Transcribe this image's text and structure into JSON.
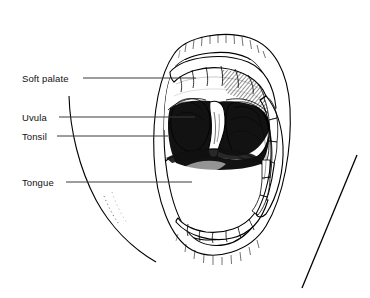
{
  "figure": {
    "style": "black and white line drawing with stipple and hatch shading",
    "background_color": "#ffffff",
    "ink_color": "#000000",
    "leader_color": "#3a3a3a"
  },
  "labels": [
    {
      "id": "soft-palate",
      "text": "Soft palate",
      "text_x": 22,
      "text_y": 82,
      "leader_start_x": 83,
      "leader_start_y": 78,
      "leader_end_x": 196,
      "leader_end_y": 78
    },
    {
      "id": "uvula",
      "text": "Uvula",
      "text_x": 22,
      "text_y": 121,
      "leader_start_x": 59,
      "leader_start_y": 117,
      "leader_end_x": 195,
      "leader_end_y": 117
    },
    {
      "id": "tonsil",
      "text": "Tonsil",
      "text_x": 22,
      "text_y": 140,
      "leader_start_x": 57,
      "leader_start_y": 136,
      "leader_end_x": 168,
      "leader_end_y": 136
    },
    {
      "id": "tongue",
      "text": "Tongue",
      "text_x": 22,
      "text_y": 186,
      "leader_start_x": 66,
      "leader_start_y": 182,
      "leader_end_x": 192,
      "leader_end_y": 182
    }
  ],
  "structures": [
    {
      "id": "upper-lip",
      "name": "upper lip"
    },
    {
      "id": "lower-lip",
      "name": "lower lip"
    },
    {
      "id": "upper-teeth",
      "name": "upper teeth row"
    },
    {
      "id": "lower-teeth",
      "name": "lower teeth row"
    },
    {
      "id": "hard-palate",
      "name": "hard palate"
    },
    {
      "id": "soft-palate",
      "name": "soft palate"
    },
    {
      "id": "uvula",
      "name": "uvula"
    },
    {
      "id": "left-tonsil",
      "name": "left tonsil"
    },
    {
      "id": "right-tonsil",
      "name": "right tonsil"
    },
    {
      "id": "oropharynx",
      "name": "throat opening"
    },
    {
      "id": "tongue",
      "name": "tongue"
    },
    {
      "id": "cheek-fold",
      "name": "right cheek fold"
    },
    {
      "id": "face-contour",
      "name": "left facial contour"
    },
    {
      "id": "tongue-depressor",
      "name": "tongue depressor"
    }
  ]
}
